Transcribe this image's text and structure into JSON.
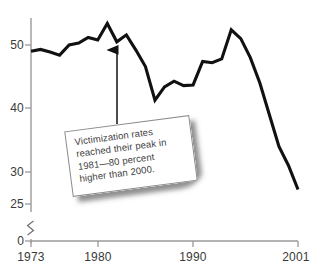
{
  "chart_data": {
    "type": "line",
    "title": "",
    "subtitle": "",
    "xlabel": "",
    "ylabel": "",
    "xlim": [
      1973,
      2001
    ],
    "ylim": [
      25,
      54
    ],
    "y_axis_break": true,
    "y_break_from": 0,
    "y_break_to": 25,
    "grid": false,
    "legend": null,
    "x_ticks": [
      1973,
      1980,
      1990,
      2001
    ],
    "x_tick_labels": [
      "1973",
      "1980",
      "1990",
      "2001"
    ],
    "y_ticks": [
      0,
      25,
      30,
      40,
      50
    ],
    "y_tick_labels": [
      "0",
      "25",
      "30",
      "40",
      "50"
    ],
    "series": [
      {
        "name": "Victimization rate",
        "color": "#111111",
        "x": [
          1973,
          1974,
          1975,
          1976,
          1977,
          1978,
          1979,
          1980,
          1981,
          1982,
          1983,
          1984,
          1985,
          1986,
          1987,
          1988,
          1989,
          1990,
          1991,
          1992,
          1993,
          1994,
          1995,
          1996,
          1997,
          1998,
          1999,
          2000,
          2001
        ],
        "values": [
          49.0,
          49.3,
          48.9,
          48.4,
          50.0,
          50.3,
          51.2,
          50.8,
          53.4,
          50.5,
          51.6,
          49.2,
          46.6,
          41.3,
          43.4,
          44.3,
          43.6,
          43.7,
          47.4,
          47.2,
          47.8,
          52.4,
          51.0,
          48.0,
          44.0,
          39.0,
          34.0,
          31.0,
          27.2
        ]
      }
    ],
    "annotations": [
      {
        "name": "peak-callout",
        "text": "Victimization rates reached their peak in 1981—80 percent higher than 2000.",
        "lines": [
          "Victimization rates",
          "reached their peak in",
          "1981—80 percent",
          "higher than 2000."
        ],
        "points_to_year": 1981,
        "points_to_value": 53.4,
        "arrow": true
      }
    ],
    "colors": {
      "line": "#111111",
      "axis": "#9a9a9a",
      "text": "#3a3a3a",
      "callout_border": "#8d8d8d",
      "callout_fill": "#ffffff",
      "callout_shadow": "#5c5c5c"
    }
  }
}
